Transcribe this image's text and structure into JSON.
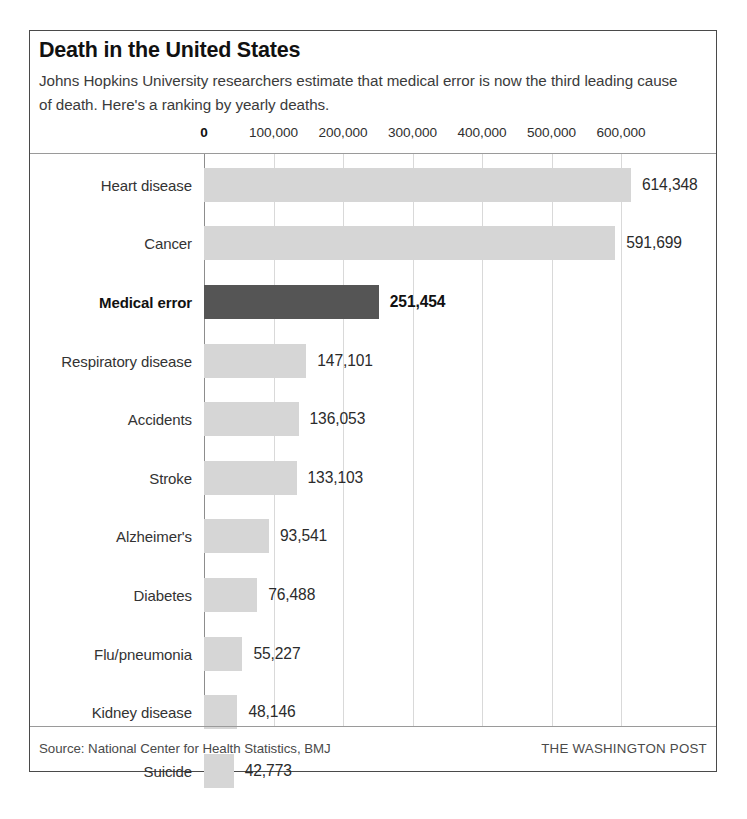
{
  "header": {
    "title": "Death in the United States",
    "subtitle": "Johns Hopkins University researchers estimate that medical error is now the third leading cause of death. Here's a ranking by yearly deaths."
  },
  "footer": {
    "source": "Source: National Center for Health Statistics, BMJ",
    "brand": "THE WASHINGTON POST"
  },
  "style": {
    "bar_color": "#d6d6d6",
    "highlight_bar_color": "#555555",
    "gridline_color": "#d9d9d9",
    "border_color": "#4a4a4a",
    "background": "#ffffff"
  },
  "chart_data": {
    "type": "bar",
    "orientation": "horizontal",
    "title": "Death in the United States",
    "subtitle": "Johns Hopkins University researchers estimate that medical error is now the third leading cause of death. Here's a ranking by yearly deaths.",
    "xlabel": "",
    "ylabel": "",
    "xlim": [
      0,
      660000
    ],
    "grid": true,
    "legend": "none",
    "axis_position": "top",
    "tick_values": [
      0,
      100000,
      200000,
      300000,
      400000,
      500000,
      600000
    ],
    "tick_labels": [
      "0",
      "100,000",
      "200,000",
      "300,000",
      "400,000",
      "500,000",
      "600,000"
    ],
    "categories": [
      "Heart disease",
      "Cancer",
      "Medical error",
      "Respiratory disease",
      "Accidents",
      "Stroke",
      "Alzheimer's",
      "Diabetes",
      "Flu/pneumonia",
      "Kidney disease",
      "Suicide"
    ],
    "values": [
      614348,
      591699,
      251454,
      147101,
      136053,
      133103,
      93541,
      76488,
      55227,
      48146,
      42773
    ],
    "value_labels": [
      "614,348",
      "591,699",
      "251,454",
      "147,101",
      "136,053",
      "133,103",
      "93,541",
      "76,488",
      "55,227",
      "48,146",
      "42,773"
    ],
    "highlight_index": 2,
    "highlight_category": "Medical error"
  }
}
